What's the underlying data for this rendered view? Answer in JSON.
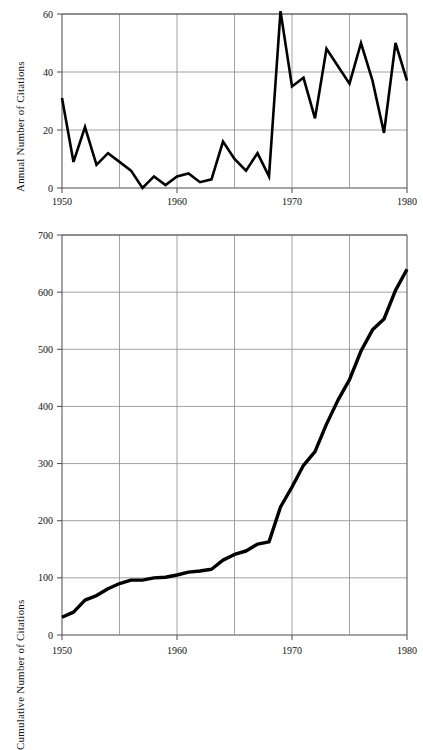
{
  "figure": {
    "background_color": "#ffffff",
    "line_color": "#000000",
    "grid_color": "#8a8a8a",
    "axis_color": "#4a4a4a"
  },
  "panels": {
    "annual": {
      "axis_title": "Annual Number of Citations",
      "y_ticks": [
        "0",
        "20",
        "40",
        "60"
      ],
      "x_ticks": [
        "1950",
        "1960",
        "1970",
        "1980"
      ]
    },
    "cumulative": {
      "axis_title": "Cumulative Number of Citations",
      "y_ticks": [
        "0",
        "100",
        "200",
        "300",
        "400",
        "500",
        "600",
        "700"
      ],
      "x_ticks": [
        "1950",
        "1960",
        "1970",
        "1980"
      ]
    }
  },
  "chart_data": [
    {
      "type": "line",
      "title": "",
      "xlabel": "",
      "ylabel": "Annual Number of Citations",
      "xlim": [
        1950,
        1980
      ],
      "ylim": [
        0,
        60
      ],
      "xticks": [
        1950,
        1960,
        1970,
        1980
      ],
      "yticks": [
        0,
        20,
        40,
        60
      ],
      "grid": true,
      "grid_x_every": 5,
      "legend": "none",
      "x": [
        1950,
        1951,
        1952,
        1953,
        1954,
        1955,
        1956,
        1957,
        1958,
        1959,
        1960,
        1961,
        1962,
        1963,
        1964,
        1965,
        1966,
        1967,
        1968,
        1969,
        1970,
        1971,
        1972,
        1973,
        1974,
        1975,
        1976,
        1977,
        1978,
        1979,
        1980
      ],
      "values": [
        31,
        9,
        21,
        8,
        12,
        9,
        6,
        0,
        4,
        1,
        4,
        5,
        2,
        3,
        16,
        10,
        6,
        12,
        4,
        61,
        35,
        38,
        24,
        48,
        42,
        36,
        50,
        37,
        19,
        50,
        37
      ]
    },
    {
      "type": "line",
      "title": "",
      "xlabel": "",
      "ylabel": "Cumulative Number of Citations",
      "xlim": [
        1950,
        1980
      ],
      "ylim": [
        0,
        700
      ],
      "xticks": [
        1950,
        1960,
        1970,
        1980
      ],
      "yticks": [
        0,
        100,
        200,
        300,
        400,
        500,
        600,
        700
      ],
      "grid": true,
      "grid_x_every": 5,
      "legend": "none",
      "x": [
        1950,
        1951,
        1952,
        1953,
        1954,
        1955,
        1956,
        1957,
        1958,
        1959,
        1960,
        1961,
        1962,
        1963,
        1964,
        1965,
        1966,
        1967,
        1968,
        1969,
        1970,
        1971,
        1972,
        1973,
        1974,
        1975,
        1976,
        1977,
        1978,
        1979,
        1980
      ],
      "values": [
        31,
        40,
        61,
        69,
        81,
        90,
        96,
        96,
        100,
        101,
        105,
        110,
        112,
        115,
        131,
        141,
        147,
        159,
        163,
        224,
        259,
        297,
        321,
        369,
        411,
        447,
        497,
        534,
        553,
        603,
        640
      ]
    }
  ]
}
